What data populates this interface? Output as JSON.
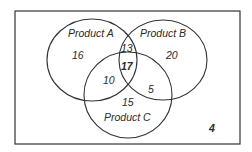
{
  "diagram": {
    "type": "venn",
    "sets": [
      {
        "name": "Product A",
        "only": 16
      },
      {
        "name": "Product B",
        "only": 20
      },
      {
        "name": "Product C",
        "only": 15
      }
    ],
    "intersections": {
      "A_B_only": 13,
      "A_C_only": 10,
      "B_C_only": 5,
      "A_B_C": 17
    },
    "outside": 4,
    "labels": {
      "a": "Product A",
      "b": "Product B",
      "c": "Product C"
    },
    "values": {
      "a_only": "16",
      "b_only": "20",
      "c_only": "15",
      "ab": "13",
      "ac": "10",
      "bc": "5",
      "abc": "17",
      "none": "4"
    },
    "colors": {
      "line": "#333333",
      "text": "#2a2a2a",
      "background": "#ffffff"
    }
  }
}
